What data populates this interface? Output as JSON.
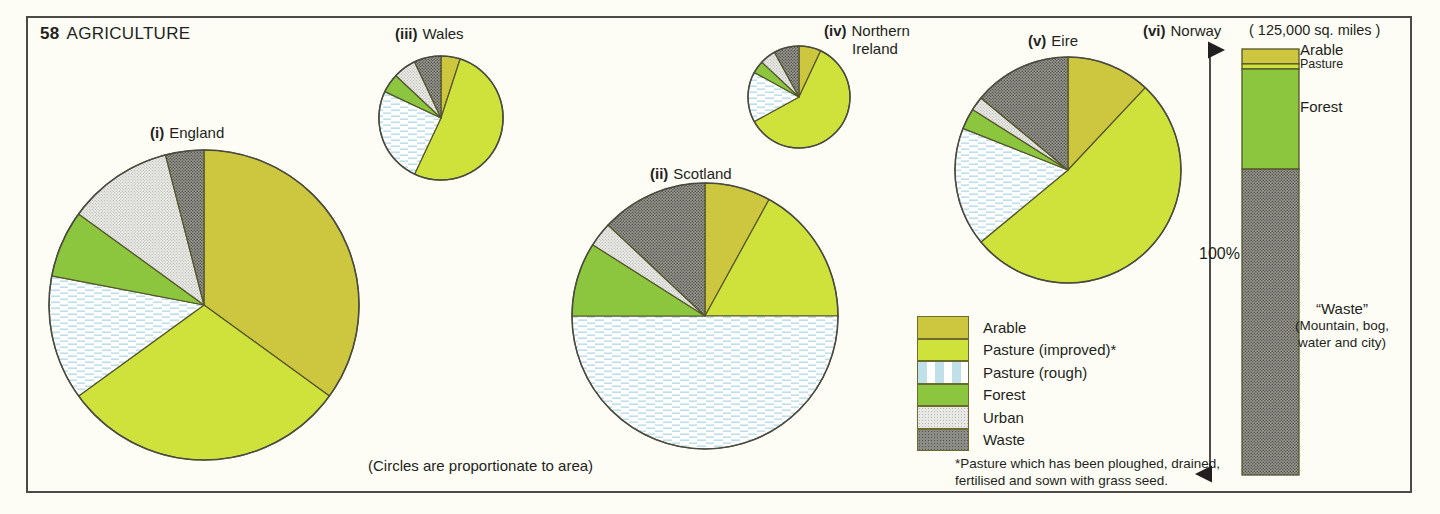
{
  "page": {
    "number": "58",
    "title": "AGRICULTURE",
    "circles_note": "(Circles are proportionate to area)",
    "footnote_line1": "*Pasture which has been ploughed, drained,",
    "footnote_line2": "fertilised and sown with grass seed."
  },
  "legend": {
    "items": [
      {
        "label": "Arable",
        "key": "arable",
        "color": "#cdc73f"
      },
      {
        "label": "Pasture (improved)*",
        "key": "pasture_improved",
        "color": "#cfe23c"
      },
      {
        "label": "Pasture (rough)",
        "key": "pasture_rough",
        "color": "#ffffff"
      },
      {
        "label": "Forest",
        "key": "forest",
        "color": "#8cc63e"
      },
      {
        "label": "Urban",
        "key": "urban",
        "color": "#e7e7e4"
      },
      {
        "label": "Waste",
        "key": "waste",
        "color": "#8c8c86"
      }
    ]
  },
  "norway": {
    "roman": "(vi)",
    "name": "Norway",
    "area_note": "( 125,000 sq. miles )",
    "scale_label": "100%",
    "bar_labels": {
      "arable": "Arable",
      "pasture": "Pasture",
      "forest": "Forest",
      "waste_main": "“Waste”",
      "waste_sub1": "(Mountain, bog,",
      "waste_sub2": "water and city)"
    }
  },
  "chart_data": {
    "type": "pie",
    "note": "Circles are proportionate to area",
    "categories": [
      "Arable",
      "Pasture (improved)*",
      "Pasture (rough)",
      "Forest",
      "Urban",
      "Waste"
    ],
    "category_colors": [
      "#cdc73f",
      "#cfe23c",
      "#ffffff",
      "#8cc63e",
      "#e7e7e4",
      "#8c8c86"
    ],
    "units": "percent of land area",
    "pies": [
      {
        "roman": "(i)",
        "name": "England",
        "cx": 204,
        "cy": 305,
        "r": 155,
        "values": [
          35,
          30,
          13,
          7,
          11,
          4
        ]
      },
      {
        "roman": "(ii)",
        "name": "Scotland",
        "cx": 705,
        "cy": 316,
        "r": 133,
        "values": [
          8,
          17,
          50,
          9,
          3,
          13
        ]
      },
      {
        "roman": "(iii)",
        "name": "Wales",
        "cx": 441,
        "cy": 118,
        "r": 62,
        "values": [
          5,
          52,
          25,
          5,
          6,
          7
        ]
      },
      {
        "roman": "(iv)",
        "name": "Northern Ireland",
        "cx": 799,
        "cy": 97,
        "r": 51,
        "values": [
          7,
          60,
          16,
          4,
          5,
          8
        ]
      },
      {
        "roman": "(v)",
        "name": "Eire",
        "cx": 1068,
        "cy": 170,
        "r": 113,
        "values": [
          12,
          52,
          17,
          3,
          2,
          14
        ]
      }
    ],
    "bar": {
      "type": "stacked_bar",
      "name": "Norway",
      "total_label": "100%",
      "area": "125,000 sq. miles",
      "segments": [
        {
          "label": "Arable",
          "percent": 3.5,
          "color": "#cdc73f"
        },
        {
          "label": "Pasture",
          "percent": 1.2,
          "color": "#cfe23c"
        },
        {
          "label": "Forest",
          "percent": 23.5,
          "color": "#8cc63e"
        },
        {
          "label": "Waste",
          "percent": 71.8,
          "color": "#8c8c86"
        }
      ]
    }
  }
}
